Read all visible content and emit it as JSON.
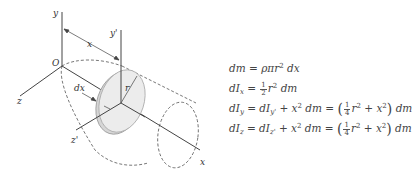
{
  "diagram": {
    "labels": {
      "y": "y",
      "y_prime": "y'",
      "x_dist": "x",
      "origin": "O",
      "z": "z",
      "z_prime": "z'",
      "dx": "dx",
      "r": "r",
      "x_axis": "x"
    },
    "colors": {
      "line": "#444444",
      "disk_fill": "#dcdcdc",
      "disk_edge": "#9a9a9a"
    }
  },
  "equations": [
    {
      "id": "dm",
      "lhs": "dm",
      "rhs": "ρπr² dx"
    },
    {
      "id": "dIx",
      "lhs": "dIₓ",
      "rhs": "½ r² dm"
    },
    {
      "id": "dIy",
      "lhs": "dI_y",
      "mid": "dI_y' + x² dm",
      "rhs": "(¼ r² + x²) dm"
    },
    {
      "id": "dIz",
      "lhs": "dI_z",
      "mid": "dI_z' + x² dm",
      "rhs": "(¼ r² + x²) dm"
    }
  ],
  "eq_parts": {
    "d": "d",
    "m": "m",
    "eq": " = ",
    "rho_pi": "ρπ",
    "r": "r",
    "two": "2",
    "x": "x",
    "I": "I",
    "sub_x": "x",
    "sub_y": "y",
    "sub_yp": "y'",
    "sub_z": "z",
    "sub_zp": "z'",
    "one": "1",
    "four": "4",
    "plus": " + ",
    "lp": "(",
    "rp": ")",
    "dm": "dm",
    "dx": "dx"
  }
}
